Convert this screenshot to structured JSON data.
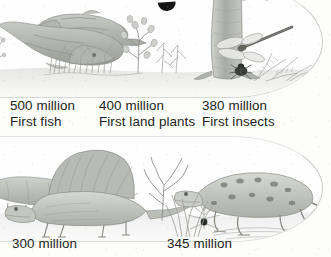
{
  "document": {
    "kind": "textbook-timeline-illustration",
    "style": "pencil sketch, grayscale scan"
  },
  "panels": [
    {
      "name": "upper-timeline-panel",
      "scenes": [
        "two prehistoric fish in water",
        "early land plants with small tree",
        "large tree trunk with dragonfly and beetle"
      ]
    },
    {
      "name": "lower-timeline-panel",
      "scenes": [
        "two sail-backed reptiles on land",
        "early amphibian beside water reeds"
      ]
    }
  ],
  "captions": [
    {
      "age": "500 million",
      "event": "First fish"
    },
    {
      "age": "400 million",
      "event": "First land plants"
    },
    {
      "age": "380 million",
      "event": "First insects"
    },
    {
      "age": "300 million",
      "event": ""
    },
    {
      "age": "345 million",
      "event": ""
    }
  ],
  "colors": {
    "ink": "#231f20",
    "paper": "#fdfdfc",
    "sketch": "#8d8f8c",
    "panel_border": "#c9cdc9"
  }
}
